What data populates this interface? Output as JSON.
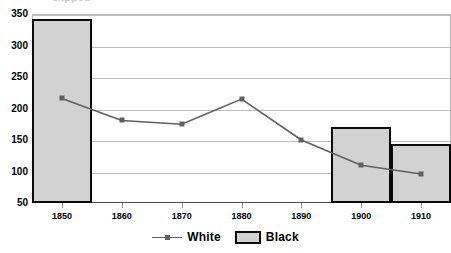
{
  "chart_data": {
    "type": "bar",
    "title": "",
    "xlabel": "",
    "ylabel": "",
    "categories": [
      "1850",
      "1860",
      "1870",
      "1880",
      "1890",
      "1900",
      "1910"
    ],
    "ylim": [
      50,
      350
    ],
    "ytick_labels": [
      "350",
      "300",
      "250",
      "200",
      "150",
      "100",
      "50"
    ],
    "ytick_values": [
      350,
      300,
      250,
      200,
      150,
      100,
      50
    ],
    "grid": true,
    "legend_position": "bottom-center",
    "series": [
      {
        "name": "White",
        "render": "line",
        "marker": "square",
        "color": "#606060",
        "values": [
          216,
          181,
          175,
          215,
          150,
          110,
          96
        ]
      },
      {
        "name": "Black",
        "render": "bar",
        "color": "#d2d2d2",
        "edge_color": "#0a0a0a",
        "values": [
          342,
          null,
          null,
          null,
          null,
          170,
          143
        ]
      }
    ]
  },
  "legend": {
    "white_label": "White",
    "black_label": "Black"
  },
  "title_remnant": "clipped"
}
